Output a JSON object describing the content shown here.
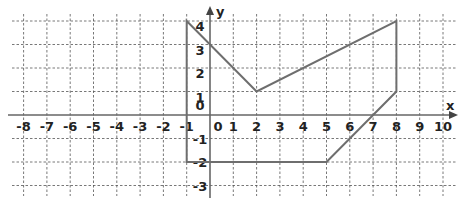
{
  "chart_data": {
    "type": "line",
    "title": "",
    "xlabel": "x",
    "ylabel": "y",
    "xlim": [
      -8,
      10
    ],
    "ylim": [
      -3,
      4
    ],
    "grid": true,
    "x_ticks": [
      -8,
      -7,
      -6,
      -5,
      -4,
      -3,
      -2,
      -1,
      0,
      1,
      2,
      3,
      4,
      5,
      6,
      7,
      8,
      9,
      10
    ],
    "y_ticks": [
      -3,
      -2,
      -1,
      0,
      1,
      2,
      3,
      4
    ],
    "x_tick_labels": [
      "-8",
      "-7",
      "-6",
      "-5",
      "-4",
      "-3",
      "-2",
      "-1",
      "0",
      "1",
      "2",
      "3",
      "4",
      "5",
      "6",
      "7",
      "8",
      "9",
      "10"
    ],
    "y_tick_labels": [
      "-3",
      "-2",
      "-1",
      "0",
      "1",
      "2",
      "3",
      "4"
    ],
    "series": [
      {
        "name": "polygon",
        "closed": true,
        "points": [
          [
            -1,
            4
          ],
          [
            2,
            1
          ],
          [
            8,
            4
          ],
          [
            8,
            1
          ],
          [
            5,
            -2
          ],
          [
            -1,
            -2
          ]
        ]
      }
    ],
    "color": "#6e6e6e"
  }
}
